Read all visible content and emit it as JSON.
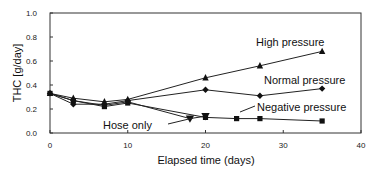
{
  "chart_data": {
    "type": "line",
    "title": "",
    "xlabel": "Elapsed time (days)",
    "ylabel": "THC [g/day]",
    "xlim": [
      0,
      40
    ],
    "ylim": [
      0.0,
      1.0
    ],
    "x_ticks": [
      "0",
      "10",
      "20",
      "30",
      "40"
    ],
    "y_ticks": [
      "0.0",
      "0.2",
      "0.4",
      "0.6",
      "0.8",
      "1.0"
    ],
    "grid": false,
    "legend": "inline annotations",
    "series": [
      {
        "name": "High pressure",
        "marker": "triangle",
        "x": [
          0,
          3,
          7,
          10,
          20,
          27,
          35
        ],
        "values": [
          0.33,
          0.29,
          0.26,
          0.28,
          0.46,
          0.56,
          0.68
        ]
      },
      {
        "name": "Normal pressure",
        "marker": "diamond",
        "x": [
          0,
          3,
          7,
          10,
          20,
          27,
          35
        ],
        "values": [
          0.33,
          0.24,
          0.24,
          0.27,
          0.36,
          0.31,
          0.37
        ]
      },
      {
        "name": "Negative pressure",
        "marker": "square",
        "x": [
          0,
          3,
          7,
          10,
          20,
          24,
          27,
          35
        ],
        "values": [
          0.33,
          0.27,
          0.22,
          0.25,
          0.13,
          0.12,
          0.12,
          0.1
        ]
      },
      {
        "name": "Hose only",
        "marker": "inverted-triangle",
        "x": [
          0,
          3,
          7,
          10,
          18,
          20
        ],
        "values": [
          0.33,
          0.27,
          0.23,
          0.26,
          0.12,
          0.14
        ]
      }
    ],
    "annotations": [
      "High pressure",
      "Normal pressure",
      "Negative pressure",
      "Hose only"
    ]
  }
}
